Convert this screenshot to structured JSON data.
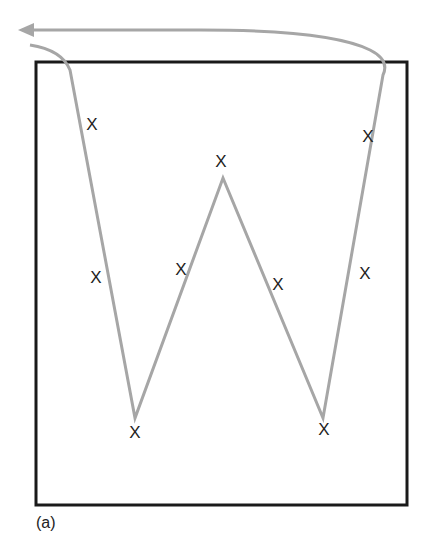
{
  "caption": "(a)",
  "colors": {
    "frame": "#1a1a1a",
    "path": "#a6a6a6",
    "marker": "#222222"
  },
  "frame": {
    "x": 36,
    "y": 62,
    "width": 371,
    "height": 443
  },
  "path": {
    "points": [
      [
        30,
        45
      ],
      [
        70,
        62
      ],
      [
        135,
        418
      ],
      [
        223,
        178
      ],
      [
        323,
        418
      ],
      [
        385,
        62
      ]
    ],
    "return_arrow": {
      "from": [
        385,
        62
      ],
      "to": [
        22,
        30
      ]
    }
  },
  "markers": [
    {
      "label": "X",
      "x": 92,
      "y": 124
    },
    {
      "label": "X",
      "x": 96,
      "y": 277
    },
    {
      "label": "X",
      "x": 135,
      "y": 432
    },
    {
      "label": "X",
      "x": 181,
      "y": 269
    },
    {
      "label": "X",
      "x": 221,
      "y": 161
    },
    {
      "label": "X",
      "x": 278,
      "y": 284
    },
    {
      "label": "X",
      "x": 324,
      "y": 429
    },
    {
      "label": "X",
      "x": 365,
      "y": 273
    },
    {
      "label": "X",
      "x": 368,
      "y": 136
    }
  ]
}
